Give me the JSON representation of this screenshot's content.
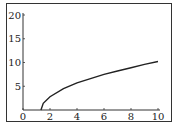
{
  "chart_data": {
    "type": "line",
    "title": "",
    "xlabel": "",
    "ylabel": "",
    "xlim": [
      0,
      10
    ],
    "ylim": [
      0,
      20
    ],
    "x_ticks": [
      "0",
      "2",
      "4",
      "6",
      "8",
      "10"
    ],
    "y_ticks": [
      "5",
      "10",
      "15",
      "20"
    ],
    "grid": false,
    "legend": "none",
    "series": [
      {
        "name": "curve",
        "color": "#222222",
        "x": [
          1.33,
          1.5,
          2,
          3,
          4,
          5,
          6,
          7,
          8,
          9,
          10
        ],
        "y": [
          0,
          1.4,
          2.8,
          4.5,
          5.7,
          6.6,
          7.5,
          8.2,
          8.9,
          9.6,
          10.2
        ]
      }
    ]
  }
}
